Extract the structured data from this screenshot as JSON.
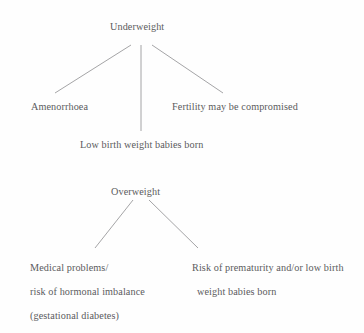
{
  "diagram": {
    "title_hidden": "",
    "background_color": "#fefefe",
    "text_color": "#5b5b5d",
    "line_color": "#9a9a9c",
    "trees": [
      {
        "id": "underweight",
        "root": "Underweight",
        "children": [
          {
            "id": "amenorrhoea",
            "label": "Amenorrhoea"
          },
          {
            "id": "low-birth-weight",
            "label": "Low birth weight babies born"
          },
          {
            "id": "fertility",
            "label": "Fertility may be compromised"
          }
        ]
      },
      {
        "id": "overweight",
        "root": "Overweight",
        "children": [
          {
            "id": "medical-problems",
            "lines": [
              "Medical problems/",
              "risk of hormonal imbalance",
              "(gestational diabetes)"
            ]
          },
          {
            "id": "prematurity-risk",
            "lines": [
              "Risk of prematurity and/or low birth",
              "weight babies born"
            ]
          }
        ]
      }
    ]
  }
}
